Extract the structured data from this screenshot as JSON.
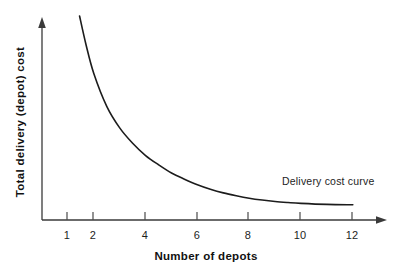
{
  "chart_data": {
    "type": "line",
    "title": "",
    "xlabel": "Number of depots",
    "ylabel": "Total delivery (depot) cost",
    "xlim": [
      0,
      13
    ],
    "ylim": [
      0,
      100
    ],
    "grid": false,
    "legend": "none",
    "annotations": [
      {
        "name": "curve-label",
        "text": "Delivery cost curve",
        "x": 10.0,
        "y": 22
      }
    ],
    "xticks": [
      1,
      2,
      4,
      6,
      8,
      10,
      12
    ],
    "xtick_labels": [
      "1",
      "2",
      "4",
      "6",
      "8",
      "10",
      "12"
    ],
    "yticks": [],
    "ytick_labels": [],
    "series": [
      {
        "name": "Delivery cost curve",
        "color": "#1c1c1c",
        "x": [
          1.45,
          1.7,
          2,
          2.5,
          3,
          3.5,
          4,
          4.5,
          5,
          5.5,
          6,
          6.5,
          7,
          7.5,
          8,
          8.5,
          9,
          9.5,
          10,
          11,
          12
        ],
        "values": [
          100,
          86,
          72,
          56,
          45.5,
          38,
          32,
          27.5,
          23.5,
          20.5,
          17.8,
          15.6,
          13.8,
          12.4,
          11.2,
          10.3,
          9.6,
          9.1,
          8.7,
          8.2,
          8.0
        ]
      }
    ]
  },
  "axes": {
    "x_title": "Number of depots",
    "y_title": "Total delivery (depot) cost",
    "tick_labels": [
      "1",
      "2",
      "4",
      "6",
      "8",
      "10",
      "12"
    ]
  },
  "annotation": {
    "curve_label": "Delivery cost curve"
  },
  "colors": {
    "curve": "#1c1c1c",
    "axis": "#3a3a3a",
    "text": "#1d1d1d",
    "background": "#ffffff"
  }
}
